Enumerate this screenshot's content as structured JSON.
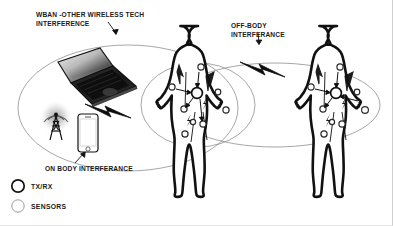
{
  "diagram": {
    "background_color": "#ffffff",
    "stroke_color": "#111111",
    "ellipse_color": "#8a8a8a"
  },
  "labels": {
    "wban": "WBAN -OTHER WIRELESS TECH\nINTERFERENCE",
    "off_body": "OFF-BODY\nINTERFERANCE",
    "on_body": "ON BODY INTERFERANCE"
  },
  "legend": {
    "items": [
      {
        "label": "TX/RX",
        "marker": "circle-outline-bold"
      },
      {
        "label": "SENSORS",
        "marker": "circle-outline-thin"
      }
    ]
  },
  "devices": [
    {
      "name": "laptop",
      "icon": "laptop-icon"
    },
    {
      "name": "antenna-tower",
      "icon": "antenna-tower-icon"
    },
    {
      "name": "smartphone",
      "icon": "smartphone-icon"
    }
  ],
  "bodies": [
    {
      "name": "body-left",
      "sensor_count": 8,
      "txrx_count": 1
    },
    {
      "name": "body-right",
      "sensor_count": 8,
      "txrx_count": 1
    }
  ],
  "interference_bolts": [
    {
      "name": "bolt-device-to-body",
      "direction": "right"
    },
    {
      "name": "bolt-body-to-body",
      "direction": "right"
    }
  ],
  "coverage_ellipses": [
    {
      "name": "ellipse-device-zone"
    },
    {
      "name": "ellipse-body-left-zone"
    },
    {
      "name": "ellipse-body-right-zone"
    }
  ]
}
